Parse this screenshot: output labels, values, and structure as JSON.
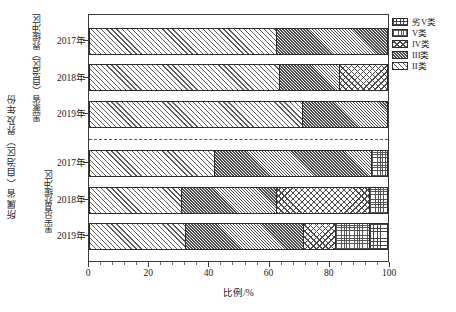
{
  "chart_data": {
    "type": "bar",
    "orientation": "horizontal",
    "stacked": true,
    "normalized": true,
    "title": "",
    "xlabel": "比例/%",
    "ylabel": "所属省（自治区）界及年份",
    "xlim": [
      0,
      100
    ],
    "xticks": [
      0,
      20,
      40,
      60,
      80,
      100
    ],
    "xtick_labels": [
      "0",
      "20",
      "40",
      "60",
      "80",
      "100"
    ],
    "grid": false,
    "legend_position": "top-right",
    "legend": [
      "劣V类",
      "V类",
      "IV类",
      "III类",
      "II类"
    ],
    "series": [
      {
        "name": "II类",
        "values": [
          63.0,
          64.0,
          71.5,
          42.0,
          31.0,
          32.5
        ]
      },
      {
        "name": "III类",
        "values": [
          37.0,
          20.0,
          28.5,
          52.5,
          32.0,
          39.5
        ]
      },
      {
        "name": "IV类",
        "values": [
          0.0,
          16.0,
          0.0,
          0.0,
          31.0,
          10.5
        ]
      },
      {
        "name": "V类",
        "values": [
          0.0,
          0.0,
          0.0,
          5.5,
          6.0,
          11.5
        ]
      },
      {
        "name": "劣V类",
        "values": [
          0.0,
          0.0,
          0.0,
          0.0,
          0.0,
          6.0
        ]
      }
    ],
    "categories": [
      "2017年",
      "2018年",
      "2019年",
      "2017年",
      "2018年",
      "2019年"
    ],
    "groups": [
      {
        "label": "黑蒙省（自治区）界缓冲区",
        "categories": [
          "2017年",
          "2018年",
          "2019年"
        ]
      },
      {
        "label": "黑吉省界缓冲区",
        "categories": [
          "2017年",
          "2018年",
          "2019年"
        ]
      }
    ],
    "bars": [
      {
        "group": 0,
        "category": "2017年",
        "segments": [
          {
            "class": "II类",
            "value": 63.0
          },
          {
            "class": "III类",
            "value": 37.0
          }
        ]
      },
      {
        "group": 0,
        "category": "2018年",
        "segments": [
          {
            "class": "II类",
            "value": 64.0
          },
          {
            "class": "III类",
            "value": 20.0
          },
          {
            "class": "IV类",
            "value": 16.0
          }
        ]
      },
      {
        "group": 0,
        "category": "2019年",
        "segments": [
          {
            "class": "II类",
            "value": 71.5
          },
          {
            "class": "III类",
            "value": 28.5
          }
        ]
      },
      {
        "group": 1,
        "category": "2017年",
        "segments": [
          {
            "class": "II类",
            "value": 42.0
          },
          {
            "class": "III类",
            "value": 52.5
          },
          {
            "class": "V类",
            "value": 5.5
          }
        ]
      },
      {
        "group": 1,
        "category": "2018年",
        "segments": [
          {
            "class": "II类",
            "value": 31.0
          },
          {
            "class": "III类",
            "value": 32.0
          },
          {
            "class": "IV类",
            "value": 31.0
          },
          {
            "class": "V类",
            "value": 6.0
          }
        ]
      },
      {
        "group": 1,
        "category": "2019年",
        "segments": [
          {
            "class": "II類",
            "value": 32.5
          },
          {
            "class": "III类",
            "value": 39.5
          },
          {
            "class": "IV类",
            "value": 10.5
          },
          {
            "class": "V类",
            "value": 11.5
          },
          {
            "class": "劣V类",
            "value": 6.0
          }
        ]
      }
    ]
  },
  "axis": {
    "y_title": "所属省（自治区）界及年份",
    "x_title": "比例/%",
    "x_tick_labels": [
      "0",
      "20",
      "40",
      "60",
      "80",
      "100"
    ]
  },
  "groups": [
    {
      "label": "黑蒙省（自治区）界缓冲区"
    },
    {
      "label": "黑吉省界缓冲区"
    }
  ],
  "category_labels": [
    "2017年",
    "2018年",
    "2019年",
    "2017年",
    "2018年",
    "2019年"
  ],
  "legend": {
    "items": [
      {
        "label": "劣V类",
        "pattern": "grid"
      },
      {
        "label": "V类",
        "pattern": "dotted-grid"
      },
      {
        "label": "IV类",
        "pattern": "crosshatch"
      },
      {
        "label": "III类",
        "pattern": "dense-diagonal"
      },
      {
        "label": "II类",
        "pattern": "sparse-diagonal"
      }
    ]
  },
  "colors": {
    "ink": "#1a1a1a",
    "frame": "#3a3a3a",
    "pattern": "#4a4a4a",
    "background": "#ffffff"
  }
}
